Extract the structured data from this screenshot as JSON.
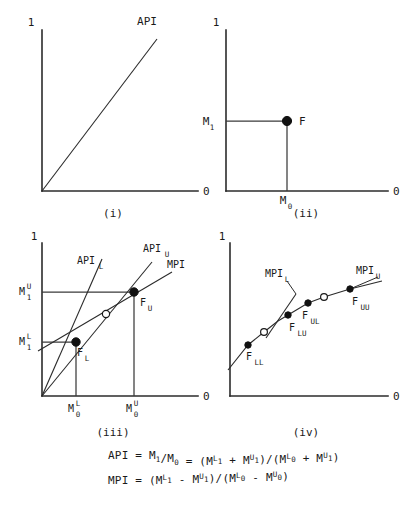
{
  "figure": {
    "title": "",
    "background": "#ffffff",
    "ink": "#1a1a1a",
    "panels": [
      {
        "id": "(i)",
        "axis_top_label": "1",
        "axis_right_label": "0",
        "curve_label": "API",
        "description": "Straight ray from origin rising to the right labelled API"
      },
      {
        "id": "(ii)",
        "axis_top_label": "1",
        "axis_right_label": "0",
        "y_tick": {
          "base": "M",
          "sub": "1",
          "sup": ""
        },
        "x_tick": {
          "base": "M",
          "sub": "0",
          "sup": ""
        },
        "point_label": "F",
        "description": "Single point F located at (M0, M1) with dashed-style guide lines"
      },
      {
        "id": "(iii)",
        "axis_top_label": "1",
        "axis_right_label": "0",
        "y_ticks": [
          {
            "base": "M",
            "sub": "1",
            "sup": "U"
          },
          {
            "base": "M",
            "sub": "1",
            "sup": "L"
          }
        ],
        "x_ticks": [
          {
            "base": "M",
            "sub": "0",
            "sup": "L"
          },
          {
            "base": "M",
            "sub": "0",
            "sup": "U"
          }
        ],
        "line_labels": [
          {
            "base": "API",
            "sub": "L",
            "sup": ""
          },
          {
            "base": "API",
            "sub": "U",
            "sup": ""
          },
          {
            "base": "MPI",
            "sub": "",
            "sup": ""
          }
        ],
        "point_labels": [
          {
            "base": "F",
            "sub": "L",
            "sup": ""
          },
          {
            "base": "F",
            "sub": "U",
            "sup": ""
          }
        ],
        "description": "Two rays from origin through F_L and F_U plus an MPI chord with an open circle midway"
      },
      {
        "id": "(iv)",
        "axis_top_label": "1",
        "axis_right_label": "0",
        "line_labels": [
          {
            "base": "MPI",
            "sub": "L",
            "sup": ""
          },
          {
            "base": "MPI",
            "sub": "U",
            "sup": ""
          }
        ],
        "point_labels": [
          {
            "base": "F",
            "sub": "LL",
            "sup": ""
          },
          {
            "base": "F",
            "sub": "LU",
            "sup": ""
          },
          {
            "base": "F",
            "sub": "UL",
            "sup": ""
          },
          {
            "base": "F",
            "sub": "UU",
            "sup": ""
          }
        ],
        "description": "Concave rising path through F_LL, F_LU, F_UL, F_UU with two open circles"
      }
    ],
    "formulas": [
      {
        "name": "api-formula",
        "parts": [
          {
            "t": "API",
            "k": "base"
          },
          {
            "t": " = ",
            "k": "base"
          },
          {
            "t": "M",
            "k": "base"
          },
          {
            "t": "1",
            "k": "sub"
          },
          {
            "t": "/",
            "k": "base"
          },
          {
            "t": "M",
            "k": "base"
          },
          {
            "t": "0",
            "k": "sub"
          },
          {
            "t": " = ",
            "k": "base"
          },
          {
            "t": "(M",
            "k": "base"
          },
          {
            "t": "L",
            "k": "sup"
          },
          {
            "t": "1",
            "k": "sub"
          },
          {
            "t": " + ",
            "k": "base"
          },
          {
            "t": "M",
            "k": "base"
          },
          {
            "t": "U",
            "k": "sup"
          },
          {
            "t": "1",
            "k": "sub"
          },
          {
            "t": ")/(M",
            "k": "base"
          },
          {
            "t": "L",
            "k": "sup"
          },
          {
            "t": "0",
            "k": "sub"
          },
          {
            "t": " + ",
            "k": "base"
          },
          {
            "t": "M",
            "k": "base"
          },
          {
            "t": "U",
            "k": "sup"
          },
          {
            "t": "1",
            "k": "sub"
          },
          {
            "t": ")",
            "k": "base"
          }
        ],
        "plain": "API = M1/M0 = (M1^L + M1^U)/(M0^L + M1^U)"
      },
      {
        "name": "mpi-formula",
        "parts": [
          {
            "t": "MPI",
            "k": "base"
          },
          {
            "t": " = ",
            "k": "base"
          },
          {
            "t": "(M",
            "k": "base"
          },
          {
            "t": "L",
            "k": "sup"
          },
          {
            "t": "1",
            "k": "sub"
          },
          {
            "t": " - ",
            "k": "base"
          },
          {
            "t": "M",
            "k": "base"
          },
          {
            "t": "U",
            "k": "sup"
          },
          {
            "t": "1",
            "k": "sub"
          },
          {
            "t": ")/(M",
            "k": "base"
          },
          {
            "t": "L",
            "k": "sup"
          },
          {
            "t": "0",
            "k": "sub"
          },
          {
            "t": " - ",
            "k": "base"
          },
          {
            "t": "M",
            "k": "base"
          },
          {
            "t": "U",
            "k": "sup"
          },
          {
            "t": "0",
            "k": "sub"
          },
          {
            "t": ")",
            "k": "base"
          }
        ],
        "plain": "MPI = (M1^L - M1^U)/(M0^L - M0^U)"
      }
    ]
  },
  "chart_data": {
    "type": "line",
    "title": "",
    "xlabel": "",
    "ylabel": "",
    "panels": [
      {
        "id": "(i)",
        "type": "line",
        "series": [
          {
            "name": "API",
            "x": [
              0,
              1
            ],
            "y": [
              0,
              1
            ]
          }
        ],
        "axis_corner_labels": {
          "y_top": "1",
          "x_right": "0"
        },
        "grid": false,
        "legend": "inline-end-label"
      },
      {
        "id": "(ii)",
        "type": "scatter",
        "points": [
          {
            "label": "F",
            "x": 0.52,
            "y": 0.62,
            "marker": "filled"
          }
        ],
        "guides": [
          {
            "from": [
              0,
              0.62
            ],
            "to": [
              0.52,
              0.62
            ]
          },
          {
            "from": [
              0.52,
              0
            ],
            "to": [
              0.52,
              0.62
            ]
          }
        ],
        "tick_labels": {
          "y": [
            "M1"
          ],
          "x": [
            "M0"
          ]
        },
        "axis_corner_labels": {
          "y_top": "1",
          "x_right": "0"
        },
        "grid": false
      },
      {
        "id": "(iii)",
        "type": "line",
        "series": [
          {
            "name": "API_L",
            "x": [
              0,
              0.3
            ],
            "y": [
              0,
              0.44
            ],
            "note": "ray through F_L"
          },
          {
            "name": "API_U",
            "x": [
              0,
              0.62
            ],
            "y": [
              0,
              0.78
            ],
            "note": "ray through F_U"
          },
          {
            "name": "MPI",
            "x": [
              0.3,
              0.62
            ],
            "y": [
              0.44,
              0.78
            ],
            "note": "chord F_L to F_U"
          }
        ],
        "points": [
          {
            "label": "F_L",
            "x": 0.3,
            "y": 0.44,
            "marker": "filled"
          },
          {
            "label": "F_U",
            "x": 0.62,
            "y": 0.78,
            "marker": "filled"
          },
          {
            "label": "",
            "x": 0.455,
            "y": 0.6,
            "marker": "open"
          }
        ],
        "tick_labels": {
          "y": [
            "M1^U",
            "M1^L"
          ],
          "x": [
            "M0^L",
            "M0^U"
          ]
        },
        "axis_corner_labels": {
          "y_top": "1",
          "x_right": "0"
        },
        "grid": false
      },
      {
        "id": "(iv)",
        "type": "line",
        "series": [
          {
            "name": "path",
            "x": [
              0.02,
              0.14,
              0.24,
              0.33,
              0.52,
              0.62,
              0.72
            ],
            "y": [
              0.06,
              0.24,
              0.34,
              0.43,
              0.56,
              0.6,
              0.64
            ],
            "note": "concave rising path through the four F points"
          },
          {
            "name": "MPI_L",
            "x": [
              0.25,
              0.42
            ],
            "y": [
              0.3,
              0.76
            ],
            "note": "steep tangent at lower segment"
          },
          {
            "name": "MPI_U",
            "x": [
              0.62,
              0.88
            ],
            "y": [
              0.6,
              0.74
            ],
            "note": "shallow tangent at upper segment"
          }
        ],
        "points": [
          {
            "label": "F_LL",
            "x": 0.14,
            "y": 0.24,
            "marker": "filled"
          },
          {
            "label": "",
            "x": 0.24,
            "y": 0.34,
            "marker": "open"
          },
          {
            "label": "F_LU",
            "x": 0.33,
            "y": 0.43,
            "marker": "filled"
          },
          {
            "label": "F_UL",
            "x": 0.52,
            "y": 0.56,
            "marker": "filled"
          },
          {
            "label": "",
            "x": 0.62,
            "y": 0.6,
            "marker": "open"
          },
          {
            "label": "F_UU",
            "x": 0.72,
            "y": 0.64,
            "marker": "filled"
          }
        ],
        "axis_corner_labels": {
          "y_top": "1",
          "x_right": "0"
        },
        "grid": false
      }
    ]
  }
}
